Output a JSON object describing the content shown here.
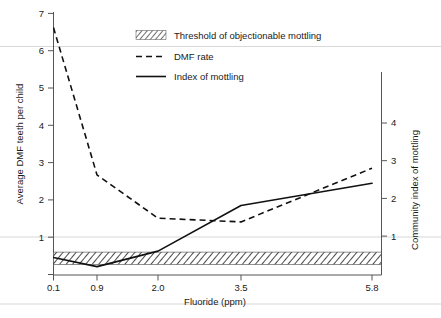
{
  "chart_data": {
    "type": "line",
    "title": "",
    "xlabel": "Fluoride (ppm)",
    "ylabel": "Average DMF teeth per child",
    "y2label": "Community index of mottling",
    "x": [
      0.1,
      0.9,
      2.0,
      3.5,
      5.8
    ],
    "x_tick_labels": [
      "0.1",
      "0.9",
      "2.0",
      "3.5",
      "5.8"
    ],
    "y_tick_labels": [
      "1",
      "2",
      "3",
      "4",
      "5",
      "6",
      "7"
    ],
    "y_ticks": [
      1,
      2,
      3,
      4,
      5,
      6,
      7
    ],
    "ylim": [
      0,
      7.35
    ],
    "y2_tick_labels": [
      "1",
      "2",
      "3",
      "4"
    ],
    "y2_ticks": [
      1,
      2,
      3,
      4
    ],
    "y2lim": [
      0,
      4.9
    ],
    "grid": false,
    "legend_position": "top-center",
    "series": [
      {
        "name": "DMF rate",
        "style": "dashed",
        "axis": "left",
        "values": [
          6.62,
          2.67,
          1.51,
          1.41,
          2.85
        ]
      },
      {
        "name": "Index of mottling",
        "style": "solid",
        "axis": "right",
        "values": [
          0.45,
          0.21,
          0.62,
          1.83,
          2.42
        ]
      }
    ],
    "band": {
      "name": "Threshold of objectionable mottling",
      "style": "hatched",
      "y_low": 0.27,
      "y_high": 0.6
    }
  },
  "legend": {
    "items": [
      {
        "label": "Threshold of objectionable mottling",
        "marker": "hatch-swatch"
      },
      {
        "label": "DMF rate",
        "marker": "dashed-line"
      },
      {
        "label": "Index of mottling",
        "marker": "solid-line"
      }
    ]
  }
}
